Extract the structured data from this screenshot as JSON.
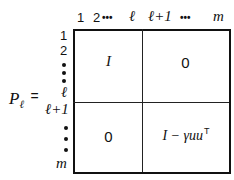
{
  "matrix_label": "P",
  "matrix_label_sub": "ℓ",
  "equals": "=",
  "col_labels": {
    "c1": "1",
    "c2": "2",
    "dots_a": "•••",
    "c_l": "ℓ",
    "c_l1": "ℓ+1",
    "dots_b": "•••",
    "c_m": "m"
  },
  "row_labels": {
    "r1": "1",
    "r2": "2",
    "r_l": "ℓ",
    "r_l1": "ℓ+1",
    "r_m": "m"
  },
  "blocks": {
    "top_left": "I",
    "top_right": "0",
    "bottom_left": "0",
    "bottom_right": "I − γuu",
    "bottom_right_sup": "T"
  }
}
